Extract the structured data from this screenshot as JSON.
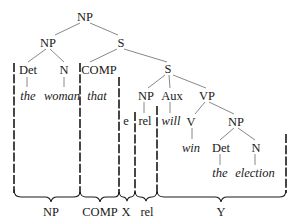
{
  "tree": {
    "root": "NP",
    "nodes": {
      "np_root": "NP",
      "np_sub": "NP",
      "det1": "Det",
      "n1": "N",
      "s_rel": "S",
      "comp": "COMP",
      "s_inner": "S",
      "np_inner": "NP",
      "aux": "Aux",
      "vp": "VP",
      "v": "V",
      "np_obj": "NP",
      "det2": "Det",
      "n2": "N"
    },
    "leaves": {
      "the1": "the",
      "woman": "woman",
      "that": "that",
      "e": "e",
      "rel": "rel",
      "will": "will",
      "win": "win",
      "the2": "the",
      "election": "election"
    }
  },
  "brackets": [
    {
      "label": "NP"
    },
    {
      "label": "COMP"
    },
    {
      "label": "X"
    },
    {
      "label": "rel"
    },
    {
      "label": "Y"
    }
  ]
}
